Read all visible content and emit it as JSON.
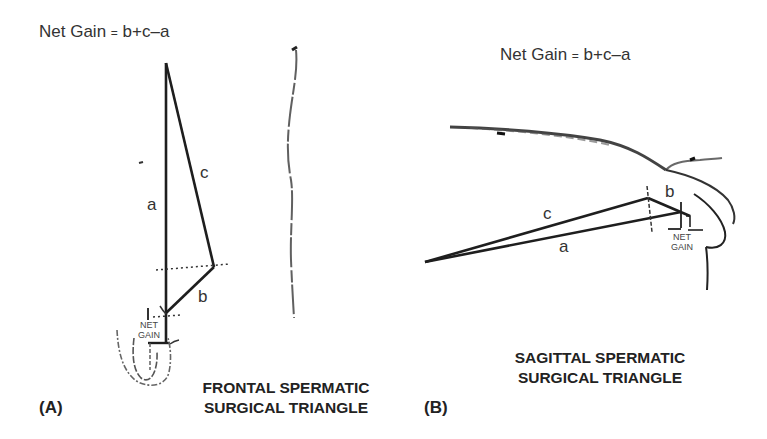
{
  "panel_a": {
    "formula": {
      "left": "Net Gain",
      "eq": "=",
      "right": "b+c–a"
    },
    "segments": {
      "a": "a",
      "b": "b",
      "c": "c"
    },
    "net_gain_label": [
      "NET",
      "GAIN"
    ],
    "caption": [
      "FRONTAL SPERMATIC",
      "SURGICAL TRIANGLE"
    ],
    "letter": "(A)"
  },
  "panel_b": {
    "formula": {
      "left": "Net Gain",
      "eq": "=",
      "right": "b+c–a"
    },
    "segments": {
      "a": "a",
      "b": "b",
      "c": "c"
    },
    "net_gain_label": [
      "NET",
      "GAIN"
    ],
    "caption": [
      "SAGITTAL SPERMATIC",
      "SURGICAL TRIANGLE"
    ],
    "letter": "(B)"
  },
  "colors": {
    "line": "#1e1e1e",
    "sketch": "#555555",
    "text": "#333333"
  }
}
